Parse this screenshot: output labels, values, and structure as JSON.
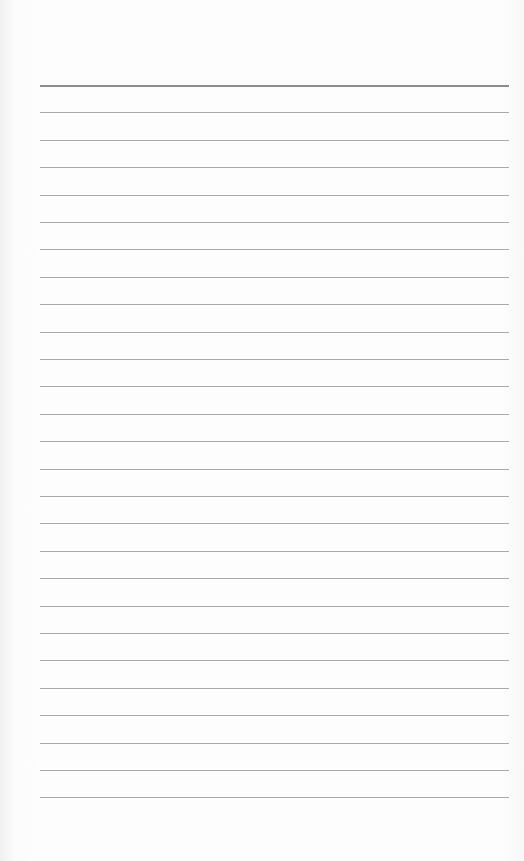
{
  "page": {
    "type": "lined-paper",
    "background_color": "#fdfdfd",
    "line_color": "#a9a9a9",
    "header_line_color": "#8c8c8c",
    "line_count": 27,
    "first_line_y": 85,
    "line_spacing": 27.4,
    "line_left": 40,
    "line_right": 509
  }
}
